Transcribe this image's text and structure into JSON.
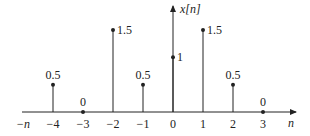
{
  "chart_data": {
    "type": "stem",
    "title": "",
    "xlabel": "n",
    "ylabel": "x[n]",
    "x_negative_label": "−n",
    "x": [
      -4,
      -3,
      -2,
      -1,
      0,
      1,
      2,
      3
    ],
    "values": [
      0.5,
      0,
      1.5,
      0.5,
      1,
      1.5,
      0.5,
      0
    ],
    "tick_labels": [
      "−4",
      "−3",
      "−2",
      "−1",
      "0",
      "1",
      "2",
      "3"
    ],
    "value_labels": [
      "0.5",
      "0",
      "1.5",
      "0.5",
      "1",
      "1.5",
      "0.5",
      "0"
    ],
    "grid": false,
    "legend": null
  },
  "colors": {
    "ink": "#222222",
    "background": "#ffffff"
  }
}
